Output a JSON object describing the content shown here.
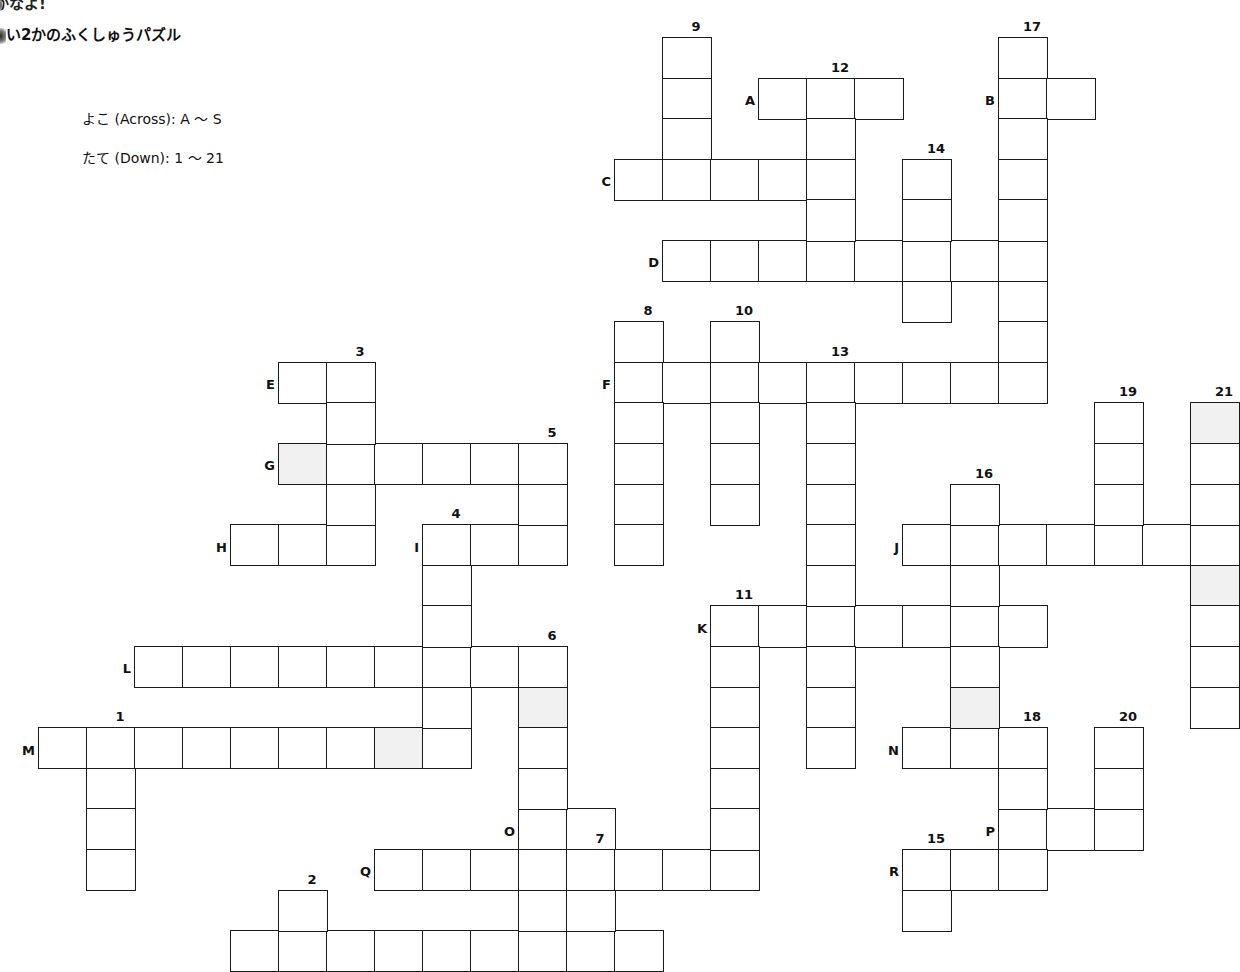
{
  "header": {
    "top_fragment": "かなよ!",
    "title": "い2かのふくしゅうパズル",
    "across_range": "よこ (Across): A 〜 S",
    "down_range": "たて (Down): 1 〜 21"
  },
  "grid_geometry": {
    "x0": 38,
    "y0": 37,
    "cell_w": 48,
    "cell_h": 40.6
  },
  "colors": {
    "line": "#1a1a1a",
    "shaded": "#f1f1f1",
    "background": "#ffffff"
  },
  "across": [
    {
      "label": "A",
      "row": 1,
      "col": 15,
      "len": 3
    },
    {
      "label": "B",
      "row": 1,
      "col": 20,
      "len": 2
    },
    {
      "label": "C",
      "row": 3,
      "col": 12,
      "len": 5
    },
    {
      "label": "D",
      "row": 5,
      "col": 13,
      "len": 8
    },
    {
      "label": "E",
      "row": 8,
      "col": 5,
      "len": 2
    },
    {
      "label": "F",
      "row": 8,
      "col": 12,
      "len": 9
    },
    {
      "label": "G",
      "row": 10,
      "col": 5,
      "len": 6
    },
    {
      "label": "H",
      "row": 12,
      "col": 4,
      "len": 3
    },
    {
      "label": "I",
      "row": 12,
      "col": 8,
      "len": 3
    },
    {
      "label": "J",
      "row": 12,
      "col": 18,
      "len": 7
    },
    {
      "label": "K",
      "row": 14,
      "col": 14,
      "len": 7
    },
    {
      "label": "L",
      "row": 15,
      "col": 2,
      "len": 9
    },
    {
      "label": "M",
      "row": 17,
      "col": 0,
      "len": 9
    },
    {
      "label": "N",
      "row": 17,
      "col": 18,
      "len": 3
    },
    {
      "label": "O",
      "row": 19,
      "col": 10,
      "len": 2
    },
    {
      "label": "P",
      "row": 19,
      "col": 20,
      "len": 3
    },
    {
      "label": "Q",
      "row": 20,
      "col": 7,
      "len": 8
    },
    {
      "label": "R",
      "row": 20,
      "col": 18,
      "len": 3
    },
    {
      "label": "",
      "row": 22,
      "col": 4,
      "len": 9
    }
  ],
  "down": [
    {
      "label": "1",
      "row": 17,
      "col": 1,
      "len": 4
    },
    {
      "label": "2",
      "row": 21,
      "col": 5,
      "len": 2
    },
    {
      "label": "3",
      "row": 8,
      "col": 6,
      "len": 5
    },
    {
      "label": "4",
      "row": 12,
      "col": 8,
      "len": 6
    },
    {
      "label": "5",
      "row": 10,
      "col": 10,
      "len": 3
    },
    {
      "label": "6",
      "row": 15,
      "col": 10,
      "len": 8
    },
    {
      "label": "7",
      "row": 20,
      "col": 11,
      "len": 3
    },
    {
      "label": "8",
      "row": 7,
      "col": 12,
      "len": 6
    },
    {
      "label": "9",
      "row": 0,
      "col": 13,
      "len": 4
    },
    {
      "label": "10",
      "row": 7,
      "col": 14,
      "len": 5
    },
    {
      "label": "11",
      "row": 14,
      "col": 14,
      "len": 7
    },
    {
      "label": "12",
      "row": 1,
      "col": 16,
      "len": 5
    },
    {
      "label": "13",
      "row": 8,
      "col": 16,
      "len": 10
    },
    {
      "label": "14",
      "row": 3,
      "col": 18,
      "len": 4
    },
    {
      "label": "15",
      "row": 20,
      "col": 18,
      "len": 2
    },
    {
      "label": "16",
      "row": 11,
      "col": 19,
      "len": 7
    },
    {
      "label": "17",
      "row": 0,
      "col": 20,
      "len": 9
    },
    {
      "label": "18",
      "row": 17,
      "col": 20,
      "len": 4
    },
    {
      "label": "19",
      "row": 9,
      "col": 22,
      "len": 4
    },
    {
      "label": "20",
      "row": 17,
      "col": 22,
      "len": 3
    },
    {
      "label": "21",
      "row": 9,
      "col": 24,
      "len": 8
    }
  ],
  "shaded_cells": [
    {
      "row": 10,
      "col": 5
    },
    {
      "row": 9,
      "col": 24
    },
    {
      "row": 13,
      "col": 24
    },
    {
      "row": 16,
      "col": 10
    },
    {
      "row": 17,
      "col": 7
    },
    {
      "row": 16,
      "col": 19
    }
  ]
}
